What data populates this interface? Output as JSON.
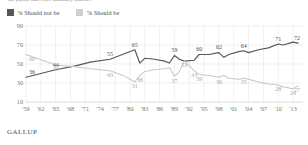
{
  "subtitle": "the public that were randomly asked...",
  "footer": "GALLUP",
  "legend": {
    "items": [
      {
        "label": "% Should not be",
        "color": "#55565a",
        "swatch": "dark"
      },
      {
        "label": "% Should be",
        "color": "#cfd0cd",
        "swatch": "light"
      }
    ]
  },
  "chart_data": {
    "type": "line",
    "title": "",
    "subtitle": "the public that were randomly asked...",
    "xlabel": "",
    "ylabel": "",
    "ylim": [
      10,
      90
    ],
    "yticks": [
      10,
      30,
      50,
      70,
      90
    ],
    "xlim": [
      1959,
      2015
    ],
    "xticks": [
      1959,
      1962,
      1965,
      1968,
      1971,
      1974,
      1977,
      1980,
      1983,
      1986,
      1989,
      1992,
      1995,
      1998,
      2001,
      2004,
      2007,
      2010,
      2013
    ],
    "xticklabels": [
      "'59",
      "'62",
      "'65",
      "'68",
      "'71",
      "'74",
      "'77",
      "'80",
      "'83",
      "'86",
      "'89",
      "'92",
      "'95",
      "'98",
      "'01",
      "'04",
      "'07",
      "'10",
      "'13"
    ],
    "grid": true,
    "legend_position": "top-left",
    "series": [
      {
        "name": "% Should not be",
        "color": "#55565a",
        "points": [
          {
            "x": 1959,
            "y": 36,
            "label": "36"
          },
          {
            "x": 1965,
            "y": 44,
            "label": "44"
          },
          {
            "x": 1969,
            "y": 48,
            "label": ""
          },
          {
            "x": 1972,
            "y": 52,
            "label": ""
          },
          {
            "x": 1976,
            "y": 55,
            "label": "55"
          },
          {
            "x": 1979,
            "y": 61,
            "label": ""
          },
          {
            "x": 1981,
            "y": 65,
            "label": "65"
          },
          {
            "x": 1982,
            "y": 51,
            "label": ""
          },
          {
            "x": 1983,
            "y": 56,
            "label": ""
          },
          {
            "x": 1985,
            "y": 55,
            "label": ""
          },
          {
            "x": 1987,
            "y": 53,
            "label": ""
          },
          {
            "x": 1988,
            "y": 51,
            "label": ""
          },
          {
            "x": 1989,
            "y": 59,
            "label": "59"
          },
          {
            "x": 1990,
            "y": 55,
            "label": ""
          },
          {
            "x": 1991,
            "y": 53,
            "label": ""
          },
          {
            "x": 1993,
            "y": 54,
            "label": ""
          },
          {
            "x": 1994,
            "y": 60,
            "label": "60"
          },
          {
            "x": 1996,
            "y": 60,
            "label": ""
          },
          {
            "x": 1998,
            "y": 62,
            "label": "62"
          },
          {
            "x": 1999,
            "y": 57,
            "label": ""
          },
          {
            "x": 2000,
            "y": 60,
            "label": ""
          },
          {
            "x": 2002,
            "y": 63,
            "label": ""
          },
          {
            "x": 2003,
            "y": 64,
            "label": "64"
          },
          {
            "x": 2004,
            "y": 62,
            "label": ""
          },
          {
            "x": 2006,
            "y": 65,
            "label": ""
          },
          {
            "x": 2008,
            "y": 67,
            "label": ""
          },
          {
            "x": 2010,
            "y": 71,
            "label": "71"
          },
          {
            "x": 2011,
            "y": 70,
            "label": ""
          },
          {
            "x": 2013,
            "y": 73,
            "label": ""
          },
          {
            "x": 2014,
            "y": 72,
            "label": "72"
          }
        ]
      },
      {
        "name": "% Should be",
        "color": "#c7c8c4",
        "points": [
          {
            "x": 1959,
            "y": 60,
            "label": "60"
          },
          {
            "x": 1965,
            "y": 49,
            "label": "49"
          },
          {
            "x": 1969,
            "y": 47,
            "label": ""
          },
          {
            "x": 1972,
            "y": 45,
            "label": ""
          },
          {
            "x": 1976,
            "y": 43,
            "label": "43"
          },
          {
            "x": 1979,
            "y": 37,
            "label": ""
          },
          {
            "x": 1981,
            "y": 31,
            "label": "31"
          },
          {
            "x": 1982,
            "y": 38,
            "label": "38"
          },
          {
            "x": 1983,
            "y": 42,
            "label": ""
          },
          {
            "x": 1985,
            "y": 44,
            "label": ""
          },
          {
            "x": 1987,
            "y": 45,
            "label": ""
          },
          {
            "x": 1988,
            "y": 46,
            "label": ""
          },
          {
            "x": 1989,
            "y": 37,
            "label": "37"
          },
          {
            "x": 1990,
            "y": 42,
            "label": ""
          },
          {
            "x": 1991,
            "y": 53,
            "label": "53"
          },
          {
            "x": 1993,
            "y": 43,
            "label": "43"
          },
          {
            "x": 1994,
            "y": 39,
            "label": "39"
          },
          {
            "x": 1996,
            "y": 38,
            "label": ""
          },
          {
            "x": 1998,
            "y": 36,
            "label": "36"
          },
          {
            "x": 1999,
            "y": 38,
            "label": ""
          },
          {
            "x": 2000,
            "y": 35,
            "label": ""
          },
          {
            "x": 2002,
            "y": 34,
            "label": ""
          },
          {
            "x": 2003,
            "y": 35,
            "label": "35"
          },
          {
            "x": 2004,
            "y": 34,
            "label": ""
          },
          {
            "x": 2006,
            "y": 31,
            "label": ""
          },
          {
            "x": 2008,
            "y": 29,
            "label": ""
          },
          {
            "x": 2010,
            "y": 28,
            "label": "28"
          },
          {
            "x": 2011,
            "y": 26,
            "label": ""
          },
          {
            "x": 2013,
            "y": 24,
            "label": "24"
          },
          {
            "x": 2014,
            "y": 27,
            "label": "27"
          }
        ]
      }
    ]
  }
}
